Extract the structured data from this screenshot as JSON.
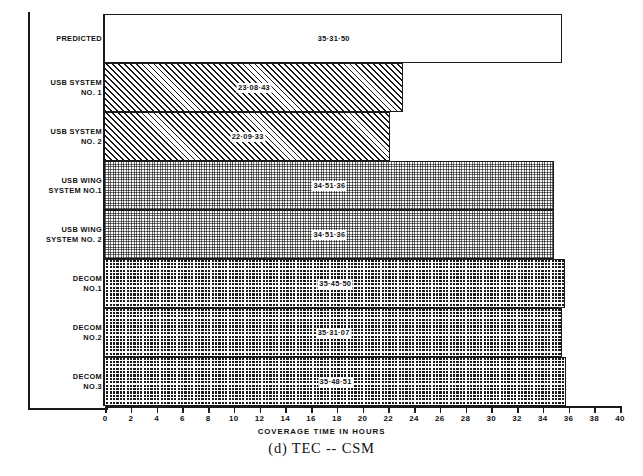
{
  "figure": {
    "caption": "(d)  TEC -- CSM",
    "axis_title": "COVERAGE TIME IN HOURS"
  },
  "chart_data": {
    "type": "bar",
    "orientation": "horizontal",
    "title": "(d)  TEC -- CSM",
    "xlabel": "COVERAGE TIME IN HOURS",
    "ylabel": "",
    "xlim": [
      0,
      40
    ],
    "xticks": [
      0,
      2,
      4,
      6,
      8,
      10,
      12,
      14,
      16,
      18,
      20,
      22,
      24,
      26,
      28,
      30,
      32,
      34,
      36,
      38,
      40
    ],
    "xtick_labels": [
      "0",
      "2",
      "4",
      "6",
      "8",
      "10",
      "12",
      "14",
      "16",
      "18",
      "20",
      "22",
      "24",
      "26",
      "28",
      "30",
      "32",
      "34",
      "36",
      "38",
      "40"
    ],
    "grid": false,
    "legend": "none",
    "categories": [
      "PREDICTED",
      "USB SYSTEM NO. 1",
      "USB SYSTEM NO. 2",
      "USB WING SYSTEM NO.1",
      "USB WING SYSTEM NO. 2",
      "DECOM NO.1",
      "DECOM NO.2",
      "DECOM NO.3"
    ],
    "values": [
      35.53,
      23.145,
      22.159,
      34.86,
      34.86,
      35.764,
      35.519,
      35.814
    ],
    "value_labels": [
      "35·31·50",
      "23·08·43",
      "22·09·33",
      "34·51·36",
      "34·51·36",
      "35·45·50",
      "35·31·07",
      "35·48·51"
    ]
  },
  "rows": [
    {
      "label_line1": "PREDICTED",
      "label_line2": "",
      "value": "35·31·50",
      "hours": 35.53,
      "pattern": "open"
    },
    {
      "label_line1": "USB SYSTEM",
      "label_line2": "NO. 1",
      "value": "23·08·43",
      "hours": 23.145,
      "pattern": "hatch"
    },
    {
      "label_line1": "USB SYSTEM",
      "label_line2": "NO. 2",
      "value": "22·09·33",
      "hours": 22.159,
      "pattern": "hatch"
    },
    {
      "label_line1": "USB WING",
      "label_line2": "SYSTEM NO.1",
      "value": "34·51·36",
      "hours": 34.86,
      "pattern": "dots-light"
    },
    {
      "label_line1": "USB WING",
      "label_line2": "SYSTEM NO. 2",
      "value": "34·51·36",
      "hours": 34.86,
      "pattern": "dots-light"
    },
    {
      "label_line1": "DECOM",
      "label_line2": "NO.1",
      "value": "35·45·50",
      "hours": 35.764,
      "pattern": "dots-dark"
    },
    {
      "label_line1": "DECOM",
      "label_line2": "NO.2",
      "value": "35·31·07",
      "hours": 35.519,
      "pattern": "dots-dark"
    },
    {
      "label_line1": "DECOM",
      "label_line2": "NO.3",
      "value": "35·48·51",
      "hours": 35.814,
      "pattern": "dots-dark"
    }
  ],
  "colors": {
    "ink": "#1a1a1a",
    "paper": "#ffffff",
    "mid": "#6f6f6f"
  }
}
